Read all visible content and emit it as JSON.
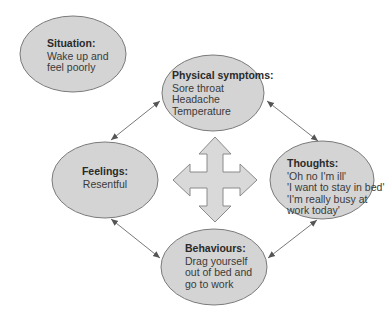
{
  "colors": {
    "ellipse_fill": "#d4d4d4",
    "ellipse_stroke": "#7a7a7a",
    "arrow": "#555555",
    "cross_fill": "#d9d9d9",
    "cross_stroke": "#8a8a8a",
    "text": "#3a3a3a"
  },
  "nodes": {
    "situation": {
      "title": "Situation:",
      "lines": [
        "Wake up and",
        "feel poorly"
      ]
    },
    "physical": {
      "title": "Physical symptoms:",
      "lines": [
        "Sore throat",
        "Headache",
        "Temperature"
      ]
    },
    "feelings": {
      "title": "Feelings:",
      "lines": [
        "Resentful"
      ]
    },
    "thoughts": {
      "title": "Thoughts:",
      "lines": [
        "'Oh no I'm ill'",
        "'I want to stay in bed'",
        "'I'm really busy at",
        "work today'"
      ]
    },
    "behaviours": {
      "title": "Behaviours:",
      "lines": [
        "Drag yourself",
        "out of bed and",
        "go to work"
      ]
    }
  },
  "connections": [
    {
      "from": "physical",
      "to": "feelings",
      "bidirectional": true
    },
    {
      "from": "physical",
      "to": "thoughts",
      "bidirectional": true
    },
    {
      "from": "feelings",
      "to": "behaviours",
      "bidirectional": true
    },
    {
      "from": "thoughts",
      "to": "behaviours",
      "bidirectional": true
    }
  ],
  "center_symbol": "four-way-arrow"
}
